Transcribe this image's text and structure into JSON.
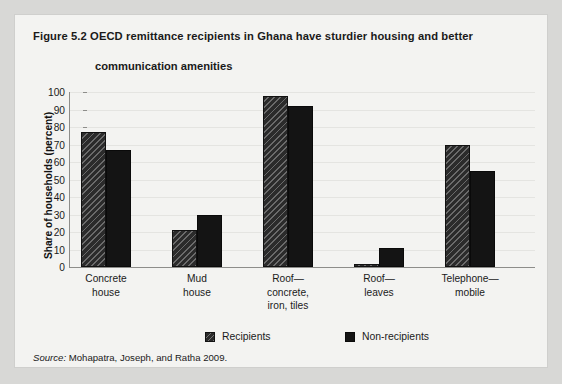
{
  "figure": {
    "label": "Figure 5.2",
    "title_line1": "OECD remittance recipients in Ghana have sturdier housing and better",
    "title_line2": "communication amenities",
    "source_label": "Source:",
    "source_text": "Mohapatra, Joseph, and Ratha 2009."
  },
  "legend": {
    "recipients": "Recipients",
    "nonrecipients": "Non-recipients"
  },
  "yticks": [
    "100",
    "90",
    "80",
    "70",
    "60",
    "50",
    "40",
    "30",
    "20",
    "10",
    "0"
  ],
  "categories_display": [
    {
      "line1": "Concrete",
      "line2": "house",
      "line3": ""
    },
    {
      "line1": "Mud",
      "line2": "house",
      "line3": ""
    },
    {
      "line1": "Roof—",
      "line2": "concrete,",
      "line3": "iron, tiles"
    },
    {
      "line1": "Roof—",
      "line2": "leaves",
      "line3": ""
    },
    {
      "line1": "Telephone—",
      "line2": "mobile",
      "line3": ""
    }
  ],
  "colors": {
    "page_background": "#d8d8d6",
    "panel_background": "#f3f3f1",
    "bar_recipients": "#2b2b2b",
    "bar_nonrecipients": "#141414",
    "axis": "#8d8d8a",
    "gridline": "#e4e4e1",
    "text": "#1a1a1a"
  },
  "chart_data": {
    "type": "bar",
    "title": "Figure 5.2  OECD remittance recipients in Ghana have sturdier housing and better communication amenities",
    "xlabel": "",
    "ylabel": "Share of households (percent)",
    "ylim": [
      0,
      100
    ],
    "ytick_values": [
      0,
      10,
      20,
      30,
      40,
      50,
      60,
      70,
      80,
      90,
      100
    ],
    "grid": true,
    "legend_position": "bottom",
    "categories": [
      "Concrete house",
      "Mud house",
      "Roof—concrete, iron, tiles",
      "Roof—leaves",
      "Telephone—mobile"
    ],
    "series": [
      {
        "name": "Recipients",
        "values": [
          77,
          21,
          98,
          2,
          70
        ]
      },
      {
        "name": "Non-recipients",
        "values": [
          67,
          30,
          92,
          11,
          55
        ]
      }
    ],
    "source": "Mohapatra, Joseph, and Ratha 2009."
  },
  "layout": {
    "plot_left": 54,
    "plot_top": 77,
    "plot_width": 466,
    "plot_height": 175,
    "group_starts": [
      66,
      157,
      248,
      339,
      430
    ],
    "bar_width": 25,
    "legend_x": [
      190,
      330
    ]
  }
}
